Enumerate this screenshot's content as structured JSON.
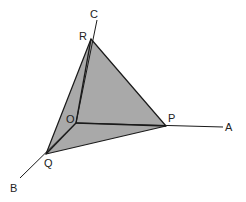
{
  "diagram": {
    "type": "3d-coordinate-axes-with-triangle",
    "colors": {
      "line": "#1a1a1a",
      "fill": "#a9a9a9",
      "background": "#ffffff"
    },
    "points": {
      "O": {
        "label": "O",
        "x": 76,
        "y": 123,
        "lx": 66,
        "ly": 123
      },
      "P": {
        "label": "P",
        "x": 166,
        "y": 126,
        "lx": 168,
        "ly": 122
      },
      "Q": {
        "label": "Q",
        "x": 46,
        "y": 154,
        "lx": 44,
        "ly": 167
      },
      "R": {
        "label": "R",
        "x": 91,
        "y": 39,
        "lx": 79,
        "ly": 40
      },
      "A": {
        "label": "A",
        "x": 223,
        "y": 127,
        "lx": 225,
        "ly": 131
      },
      "B": {
        "label": "B",
        "x": 20,
        "y": 178,
        "lx": 10,
        "ly": 192
      },
      "C": {
        "label": "C",
        "x": 97,
        "y": 20,
        "lx": 90,
        "ly": 18
      }
    },
    "axes": [
      {
        "name": "OA",
        "from": "O",
        "to": "A"
      },
      {
        "name": "OB",
        "from": "O",
        "to": "B"
      },
      {
        "name": "OC",
        "from": "O",
        "to": "C"
      }
    ],
    "triangle": [
      "P",
      "Q",
      "R"
    ]
  }
}
